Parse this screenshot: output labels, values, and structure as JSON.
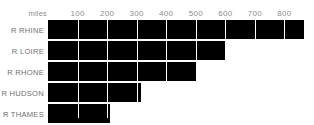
{
  "chart_data": {
    "type": "bar",
    "orientation": "horizontal",
    "title": "",
    "xlabel": "miles",
    "ylabel": "",
    "categories": [
      "R RHINE",
      "R LOIRE",
      "R RHONE",
      "R HUDSON",
      "R THAMES"
    ],
    "values": [
      865,
      600,
      505,
      315,
      210
    ],
    "xlim": [
      0,
      900
    ],
    "xticks": [
      100,
      200,
      300,
      400,
      500,
      600,
      700,
      800
    ],
    "tick_labels": [
      "100",
      "200",
      "300",
      "400",
      "500",
      "600",
      "700",
      "800"
    ],
    "grid": true,
    "grid_color": "#ffffff",
    "legend": false,
    "bar_color": "#000000",
    "background_color": "#ffffff",
    "label_color": "#6f6f6f",
    "tick_color": "#8e8e8e",
    "unit_label": "miles",
    "series": [
      {
        "name": "River length",
        "values": [
          865,
          600,
          505,
          315,
          210
        ]
      }
    ]
  }
}
